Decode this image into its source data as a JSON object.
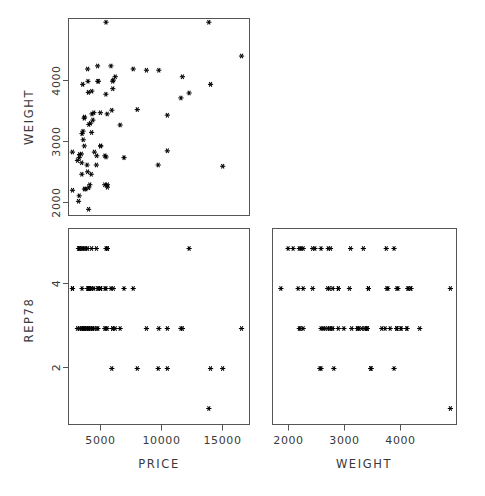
{
  "figure": {
    "type": "scatterplot-matrix",
    "background_color": "#ffffff",
    "frame_color": "#555555",
    "marker_color": "#000000",
    "marker_symbol": "asterisk",
    "variables": [
      "PRICE",
      "WEIGHT",
      "REP78"
    ],
    "layout": "lower-triangle 2x2 matrix"
  },
  "axis_titles": {
    "left_top": "WEIGHT",
    "left_bottom": "REP78",
    "bottom_left": "PRICE",
    "bottom_right": "WEIGHT"
  },
  "ticks": {
    "weight_y": [
      "2000",
      "3000",
      "4000"
    ],
    "rep78_y": [
      "2",
      "4"
    ],
    "price_x": [
      "5000",
      "10000",
      "15000"
    ],
    "weight_x": [
      "2000",
      "3000",
      "4000"
    ]
  },
  "chart_data": [
    {
      "id": "panel-weight-vs-price",
      "type": "scatter",
      "title": "",
      "xlabel": "PRICE",
      "ylabel": "WEIGHT",
      "xlim": [
        3000,
        16500
      ],
      "ylim": [
        1700,
        4900
      ],
      "xticks": [
        5000,
        10000,
        15000
      ],
      "yticks": [
        2000,
        3000,
        4000
      ],
      "grid": false,
      "legend": "none",
      "x": [
        4099,
        4749,
        3799,
        4816,
        7827,
        5788,
        4453,
        5189,
        10372,
        4082,
        11385,
        14500,
        15906,
        3299,
        5705,
        4504,
        5104,
        3667,
        3955,
        3984,
        4010,
        5886,
        6342,
        4389,
        4187,
        11497,
        13594,
        13466,
        3829,
        5379,
        6165,
        4516,
        6303,
        3291,
        8814,
        5172,
        4733,
        4890,
        4181,
        4195,
        10371,
        4647,
        4425,
        4482,
        6486,
        4060,
        5798,
        4934,
        5222,
        4723,
        4424,
        4172,
        9690,
        6295,
        9735,
        6229,
        4589,
        5079,
        8129,
        4296,
        5799,
        4499,
        5899,
        3995,
        3798,
        5899,
        3748,
        5719,
        7140,
        5397,
        4697,
        6850,
        11995,
        5397
      ],
      "y": [
        2930,
        3350,
        2640,
        3250,
        4080,
        3670,
        3880,
        3880,
        3330,
        3070,
        3610,
        2500,
        4290,
        2110,
        2200,
        2150,
        2670,
        2595,
        2700,
        2556,
        3030,
        3350,
        3900,
        2520,
        2130,
        3955,
        3830,
        4840,
        2690,
        3370,
        4130,
        3180,
        3760,
        2730,
        4060,
        4130,
        3720,
        3370,
        2830,
        3300,
        2750,
        3200,
        4080,
        3700,
        3955,
        3830,
        4840,
        2730,
        3880,
        3050,
        2410,
        3280,
        2520,
        3880,
        4060,
        3410,
        2200,
        2520,
        3420,
        2130,
        2650,
        1800,
        2200,
        2370,
        2020,
        2160,
        1930,
        2670,
        2640,
        2830,
        2370,
        3170,
        3690,
        2830
      ]
    },
    {
      "id": "panel-rep78-vs-price",
      "type": "scatter",
      "title": "",
      "xlabel": "PRICE",
      "ylabel": "REP78",
      "xlim": [
        3000,
        16500
      ],
      "ylim": [
        0.6,
        5.5
      ],
      "xticks": [
        5000,
        10000,
        15000
      ],
      "yticks": [
        2,
        4
      ],
      "grid": false,
      "legend": "none",
      "x": [
        4099,
        4749,
        3799,
        4816,
        7827,
        5788,
        4453,
        5189,
        10372,
        4082,
        11385,
        14500,
        15906,
        3299,
        5705,
        4504,
        5104,
        3667,
        3955,
        3984,
        4010,
        5886,
        6342,
        4389,
        4187,
        11497,
        13594,
        13466,
        3829,
        5379,
        6165,
        4516,
        6303,
        3291,
        8814,
        5172,
        4733,
        4890,
        4181,
        4195,
        10371,
        4647,
        4425,
        4482,
        6486,
        4060,
        5798,
        4934,
        5222,
        4723,
        4424,
        4172,
        9690,
        6295,
        9735,
        6229,
        4589,
        5079,
        8129,
        4296,
        5799,
        4499,
        5899,
        3995,
        3798,
        5899,
        3748,
        5719,
        7140,
        5397,
        4697,
        6850,
        11995,
        5397
      ],
      "y": [
        3,
        3,
        3,
        3,
        4,
        3,
        3,
        3,
        3,
        3,
        3,
        2,
        3,
        4,
        3,
        3,
        3,
        3,
        3,
        3,
        4,
        3,
        4,
        3,
        3,
        3,
        2,
        1,
        5,
        4,
        4,
        3,
        3,
        4,
        3,
        4,
        4,
        4,
        3,
        3,
        2,
        3,
        4,
        4,
        3,
        5,
        4,
        3,
        4,
        5,
        5,
        5,
        2,
        3,
        3,
        2,
        4,
        5,
        2,
        5,
        5,
        4,
        5,
        5,
        5,
        5,
        5,
        4,
        4,
        4,
        4,
        3,
        5,
        4
      ]
    },
    {
      "id": "panel-rep78-vs-weight",
      "type": "scatter",
      "title": "",
      "xlabel": "WEIGHT",
      "ylabel": "REP78",
      "xlim": [
        1650,
        4950
      ],
      "ylim": [
        0.6,
        5.5
      ],
      "xticks": [
        2000,
        3000,
        4000
      ],
      "yticks": [
        2,
        4
      ],
      "grid": false,
      "legend": "none",
      "x": [
        2930,
        3350,
        2640,
        3250,
        4080,
        3670,
        3880,
        3880,
        3330,
        3070,
        3610,
        2500,
        4290,
        2110,
        2200,
        2150,
        2670,
        2595,
        2700,
        2556,
        3030,
        3350,
        3900,
        2520,
        2130,
        3955,
        3830,
        4840,
        2690,
        3370,
        4130,
        3180,
        3760,
        2730,
        4060,
        4130,
        3720,
        3370,
        2830,
        3300,
        2750,
        3200,
        4080,
        3700,
        3955,
        3830,
        4840,
        2730,
        3880,
        3050,
        2410,
        3280,
        2520,
        3880,
        4060,
        3410,
        2200,
        2520,
        3420,
        2130,
        2650,
        1800,
        2200,
        2370,
        2020,
        2160,
        1930,
        2670,
        2640,
        2830,
        2370,
        3170,
        3690,
        2830
      ],
      "y": [
        3,
        3,
        3,
        3,
        4,
        3,
        3,
        3,
        3,
        3,
        3,
        2,
        3,
        4,
        3,
        3,
        3,
        3,
        3,
        3,
        4,
        3,
        4,
        3,
        3,
        3,
        2,
        1,
        5,
        4,
        4,
        3,
        3,
        4,
        3,
        4,
        4,
        4,
        3,
        3,
        2,
        3,
        4,
        4,
        3,
        5,
        4,
        3,
        4,
        5,
        5,
        5,
        2,
        3,
        3,
        2,
        4,
        5,
        2,
        5,
        5,
        4,
        5,
        5,
        5,
        5,
        5,
        4,
        4,
        4,
        4,
        3,
        5,
        4
      ]
    }
  ]
}
